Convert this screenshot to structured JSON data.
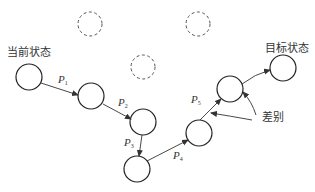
{
  "diagram": {
    "start_label": "当前状态",
    "goal_label": "目标状态",
    "difference_label": "差别",
    "states": [
      {
        "id": "s0",
        "role": "start",
        "style": "solid"
      },
      {
        "id": "s1",
        "role": "intermediate",
        "style": "solid"
      },
      {
        "id": "s2",
        "role": "intermediate",
        "style": "solid"
      },
      {
        "id": "s3",
        "role": "intermediate",
        "style": "solid"
      },
      {
        "id": "s4",
        "role": "intermediate",
        "style": "solid"
      },
      {
        "id": "s5",
        "role": "intermediate",
        "style": "solid"
      },
      {
        "id": "goal",
        "role": "goal",
        "style": "solid"
      },
      {
        "id": "d1",
        "role": "unexplored",
        "style": "dashed"
      },
      {
        "id": "d2",
        "role": "unexplored",
        "style": "dashed"
      },
      {
        "id": "d3",
        "role": "unexplored",
        "style": "dashed"
      }
    ],
    "operators": [
      {
        "name": "P",
        "sub": "1",
        "from": "s0",
        "to": "s1"
      },
      {
        "name": "P",
        "sub": "2",
        "from": "s1",
        "to": "s2"
      },
      {
        "name": "P",
        "sub": "3",
        "from": "s2",
        "to": "s3"
      },
      {
        "name": "P",
        "sub": "4",
        "from": "s3",
        "to": "s4"
      },
      {
        "name": "P",
        "sub": "5",
        "from": "s4",
        "to": "s5"
      },
      {
        "name": "",
        "sub": "",
        "from": "s5",
        "to": "goal"
      }
    ]
  }
}
